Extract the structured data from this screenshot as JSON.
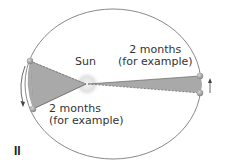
{
  "diagram": {
    "type": "kepler-second-law",
    "sun_label": "Sun",
    "sector_top_right": {
      "line1": "2 months",
      "line2": "(for example)"
    },
    "sector_bottom_left": {
      "line1": "2 months",
      "line2": "(for example)"
    },
    "panel_label": "II",
    "colors": {
      "orbit": "#7a7a7a",
      "sector_fill": "#a9a9a9",
      "planet": "#9a9a9a",
      "sun_glow": "#e6e6e6",
      "text": "#333333"
    }
  }
}
